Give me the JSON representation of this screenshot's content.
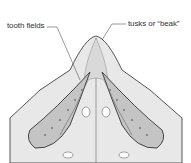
{
  "diagram": {
    "labels": {
      "tooth_fields": "tooth fields",
      "tusks": "tusks or “beak”"
    },
    "colors": {
      "outline": "#555555",
      "fill_light": "#e6e6e6",
      "fill_mid": "#cfcfcf",
      "tooth_field": "#bdbdbd",
      "background": "#ffffff"
    }
  }
}
